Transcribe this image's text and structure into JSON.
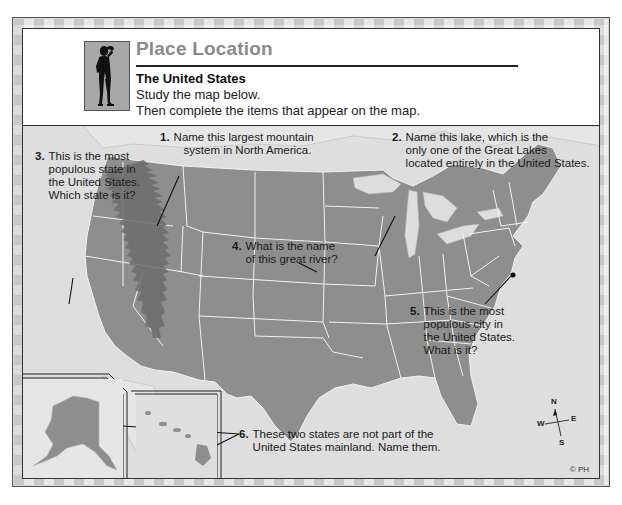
{
  "header": {
    "title": "Place Location",
    "subtitle": "The United States",
    "instructions": [
      "Study the map below.",
      "Then complete the items that appear on the map."
    ],
    "icon": "person-looking-icon"
  },
  "map": {
    "subject": "United States",
    "colors": {
      "land": "#8e8e8e",
      "water": "#dedede",
      "borders": "#f2f2f2",
      "mountains": "#6c6c6c",
      "title": "#8a8a8a"
    },
    "questions": [
      {
        "number": "1.",
        "lines": [
          "Name this largest mountain",
          "system in North America."
        ]
      },
      {
        "number": "2.",
        "lines": [
          "Name this lake, which is the",
          "only one of the Great Lakes",
          "located entirely in the United States."
        ]
      },
      {
        "number": "3.",
        "lines": [
          "This is the most",
          "populous state in",
          "the United States.",
          "Which state is it?"
        ]
      },
      {
        "number": "4.",
        "lines": [
          "What is the name",
          "of this great river?"
        ]
      },
      {
        "number": "5.",
        "lines": [
          "This is the most",
          "populous city in",
          "the United States.",
          "What is it?"
        ]
      },
      {
        "number": "6.",
        "lines": [
          "These two states are not part of the",
          "United States mainland.  Name them."
        ]
      }
    ],
    "compass": {
      "n": "N",
      "s": "S",
      "e": "E",
      "w": "W"
    },
    "copyright": "© PH"
  }
}
